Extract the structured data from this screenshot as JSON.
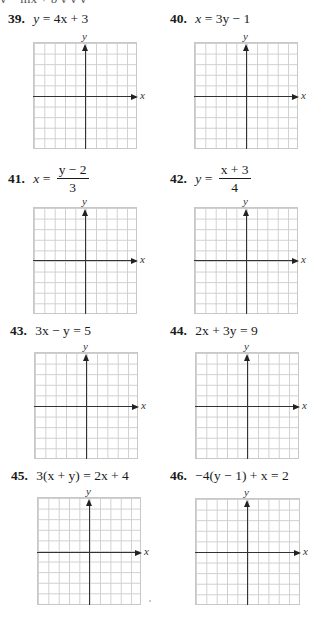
{
  "page": {
    "top_strip_text": "y = mx + b  y  y   y",
    "problems": [
      {
        "number": "39.",
        "lhs": "y",
        "rhs": "4x + 3",
        "form": "inline"
      },
      {
        "number": "40.",
        "lhs": "x",
        "rhs": "3y − 1",
        "form": "inline"
      },
      {
        "number": "41.",
        "lhs": "x",
        "numerator": "y − 2",
        "denominator": "3",
        "form": "fraction"
      },
      {
        "number": "42.",
        "lhs": "y",
        "numerator": "x + 3",
        "denominator": "4",
        "form": "fraction"
      },
      {
        "number": "43.",
        "lhs": "3x − y",
        "rhs": "5",
        "form": "inline"
      },
      {
        "number": "44.",
        "lhs": "2x + 3y",
        "rhs": "9",
        "form": "inline"
      },
      {
        "number": "45.",
        "lhs": "3(x + y)",
        "rhs": "2x + 4",
        "form": "inline"
      },
      {
        "number": "46.",
        "lhs": "−4(y − 1) + x",
        "rhs": "2",
        "form": "inline"
      }
    ],
    "axis_labels": {
      "x": "x",
      "y": "y"
    },
    "equals": "="
  },
  "grid": {
    "cells_x": 10,
    "cells_y": 10,
    "line_color": "#cfcfcf",
    "axis_color": "#333333"
  }
}
